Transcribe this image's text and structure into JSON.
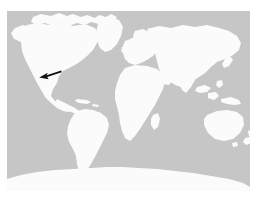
{
  "figure": {
    "kind": "world-locator-map",
    "projection": "equirectangular",
    "title": "",
    "caption": "",
    "width_px": 260,
    "height_px": 197
  },
  "map": {
    "frame": {
      "left_px": 7,
      "top_px": 11,
      "width_px": 243,
      "height_px": 180
    },
    "colors": {
      "ocean": "#c6c6c6",
      "land": "#fbfbfb",
      "background": "#ffffff",
      "marker": "#111111"
    },
    "land_labels": [
      "North America",
      "Greenland",
      "South America",
      "Europe",
      "Africa",
      "Asia",
      "Australia",
      "New Zealand",
      "Antarctica",
      "Madagascar",
      "Japan",
      "Indonesia",
      "British Isles",
      "Iceland"
    ],
    "graticule": {
      "visible": false,
      "lon_range": [
        -180,
        180
      ],
      "lat_range": [
        -90,
        90
      ]
    },
    "borders": {
      "country_borders_visible": false,
      "coastline_stroke_visible": false
    }
  },
  "marker": {
    "name": "location-arrow",
    "description": "black arrow pointing to southwestern North America",
    "points_to": "southwestern United States",
    "direction": "west-southwest",
    "tip_px": {
      "x": 40,
      "y": 77
    },
    "tail_px": {
      "x": 61,
      "y": 71
    },
    "color": "#111111",
    "label": ""
  },
  "legend": {
    "visible": false,
    "entries": []
  }
}
